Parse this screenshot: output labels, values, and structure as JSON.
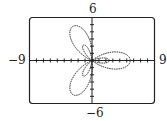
{
  "chart_data": {
    "type": "line",
    "title": "",
    "subtitle": "Polar graph: three-petal rose with inner loops",
    "xlabel": "",
    "ylabel": "",
    "xlim": [
      -9,
      9
    ],
    "ylim": [
      -6,
      6
    ],
    "grid": false,
    "tick_labels": {
      "xmin": "−9",
      "xmax": "9",
      "ymin": "−6",
      "ymax": "6"
    },
    "curve": {
      "form": "polar",
      "a": 1.5,
      "b": 4,
      "k": 3,
      "function": "cos"
    }
  },
  "labels": {
    "top": "6",
    "bottom": "−6",
    "left": "−9",
    "right": "9"
  }
}
